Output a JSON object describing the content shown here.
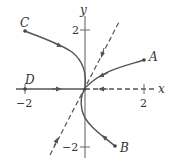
{
  "diagram": {
    "type": "phase-portrait",
    "axes": {
      "x_label": "x",
      "y_label": "y",
      "x_ticks": [
        {
          "value": -2,
          "label": "−2"
        },
        {
          "value": 2,
          "label": "2"
        }
      ],
      "y_ticks": [
        {
          "value": 2,
          "label": "2"
        },
        {
          "value": -2,
          "label": "−2"
        }
      ]
    },
    "trajectories": [
      {
        "name": "A",
        "label": "A",
        "start": [
          2.0,
          1.0
        ],
        "direction": "toward-origin"
      },
      {
        "name": "B",
        "label": "B",
        "start": [
          1.0,
          -1.9
        ],
        "direction": "toward-origin"
      },
      {
        "name": "C",
        "label": "C",
        "start": [
          -2.0,
          1.95
        ],
        "direction": "toward-origin"
      },
      {
        "name": "D",
        "label": "D",
        "start": [
          -2.0,
          0.0
        ],
        "direction": "toward-origin"
      }
    ],
    "eigenlines": [
      {
        "name": "dashed-eigenline-slope-2",
        "style": "dashed",
        "slope": 2
      },
      {
        "name": "dashed-positive-x-axis",
        "style": "dashed",
        "slope": 0
      }
    ],
    "colors": {
      "curve": "#555555",
      "axis": "#666666",
      "text": "#333333"
    }
  }
}
